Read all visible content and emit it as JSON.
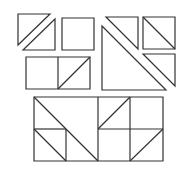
{
  "diagram": {
    "stroke_color": "#333333",
    "background": "#ffffff",
    "pieces": [
      {
        "id": "triangle-top-left-a",
        "type": "polygon",
        "points": "18,14 50,14 18,45"
      },
      {
        "id": "triangle-top-left-b",
        "type": "polygon",
        "points": "23,50 55,19 55,50"
      },
      {
        "id": "square-top-middle",
        "type": "polygon",
        "points": "62,18 94,18 94,50 62,50"
      },
      {
        "id": "triangle-right-small",
        "type": "polygon",
        "points": "106,17 138,17 138,49"
      },
      {
        "id": "square-right-diagonal",
        "type": "polygon",
        "points": "143,17 175,17 175,49 143,49"
      },
      {
        "id": "square-right-diagonal-line",
        "type": "line",
        "points": "143,17 175,49"
      },
      {
        "id": "triangle-right-lower",
        "type": "polygon",
        "points": "143,54 175,54 175,86"
      },
      {
        "id": "triangle-right-large",
        "type": "polygon",
        "points": "102,26 102,90 166,90"
      },
      {
        "id": "rectangle-middle",
        "type": "polygon",
        "points": "26,57 90,57 90,89 26,89"
      },
      {
        "id": "rectangle-middle-divider",
        "type": "line",
        "points": "58,57 58,89"
      },
      {
        "id": "rectangle-middle-diagonal",
        "type": "line",
        "points": "58,89 90,57"
      }
    ],
    "assembled": {
      "outline": "34,97 163,97 163,161 34,161",
      "lines": [
        "34,129 66,129",
        "98,129 163,129",
        "66,129 66,161",
        "98,97 98,161",
        "130,97 130,161",
        "34,97 98,161",
        "34,129 66,161",
        "98,129 130,97",
        "130,161 163,129"
      ]
    }
  }
}
